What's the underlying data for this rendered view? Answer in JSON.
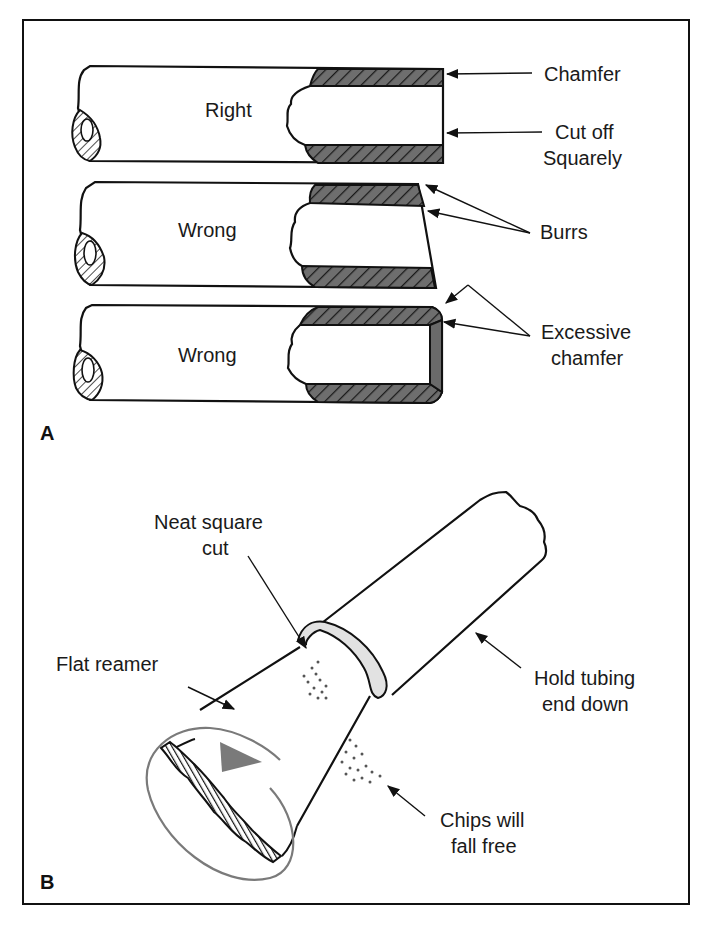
{
  "figure": {
    "panels": [
      {
        "letter": "A",
        "pipes": [
          {
            "label": "Right"
          },
          {
            "label": "Wrong"
          },
          {
            "label": "Wrong"
          }
        ],
        "callouts": {
          "chamfer": "Chamfer",
          "cut_off_line1": "Cut off",
          "cut_off_line2": "Squarely",
          "burrs": "Burrs",
          "excessive_line1": "Excessive",
          "excessive_line2": "chamfer"
        }
      },
      {
        "letter": "B",
        "callouts": {
          "neat_line1": "Neat square",
          "neat_line2": "cut",
          "flat_reamer": "Flat reamer",
          "hold_line1": "Hold tubing",
          "hold_line2": "end down",
          "chips_line1": "Chips will",
          "chips_line2": "fall free"
        }
      }
    ],
    "colors": {
      "line": "#111111",
      "hatch_fill": "#6e6e6e",
      "highlight_gray": "#7a7a7a",
      "rim_fill": "#e2e2e2"
    }
  }
}
